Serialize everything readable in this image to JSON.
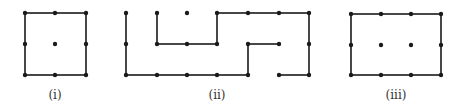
{
  "figures": [
    {
      "id": "i",
      "label": "(i)",
      "label_pos": [
        55,
        99
      ],
      "dots": [
        [
          25,
          13
        ],
        [
          55,
          13
        ],
        [
          86,
          13
        ],
        [
          25,
          44
        ],
        [
          55,
          44
        ],
        [
          86,
          44
        ],
        [
          25,
          75
        ],
        [
          55,
          75
        ],
        [
          86,
          75
        ]
      ],
      "edges": [
        [
          [
            25,
            13
          ],
          [
            55,
            13
          ]
        ],
        [
          [
            55,
            13
          ],
          [
            86,
            13
          ]
        ],
        [
          [
            25,
            13
          ],
          [
            25,
            44
          ]
        ],
        [
          [
            25,
            44
          ],
          [
            25,
            75
          ]
        ],
        [
          [
            86,
            13
          ],
          [
            86,
            44
          ]
        ],
        [
          [
            86,
            44
          ],
          [
            86,
            75
          ]
        ],
        [
          [
            25,
            75
          ],
          [
            55,
            75
          ]
        ],
        [
          [
            55,
            75
          ],
          [
            86,
            75
          ]
        ]
      ]
    },
    {
      "id": "ii",
      "label": "(ii)",
      "label_pos": [
        217,
        99
      ],
      "dots": [
        [
          126,
          13
        ],
        [
          157,
          13
        ],
        [
          187,
          13
        ],
        [
          217,
          13
        ],
        [
          248,
          13
        ],
        [
          279,
          13
        ],
        [
          309,
          13
        ],
        [
          126,
          44
        ],
        [
          157,
          44
        ],
        [
          187,
          44
        ],
        [
          217,
          44
        ],
        [
          248,
          44
        ],
        [
          279,
          44
        ],
        [
          309,
          44
        ],
        [
          126,
          75
        ],
        [
          157,
          75
        ],
        [
          187,
          75
        ],
        [
          217,
          75
        ],
        [
          248,
          75
        ],
        [
          279,
          75
        ],
        [
          309,
          75
        ]
      ],
      "edges": [
        [
          [
            126,
            13
          ],
          [
            126,
            44
          ]
        ],
        [
          [
            126,
            44
          ],
          [
            126,
            75
          ]
        ],
        [
          [
            126,
            75
          ],
          [
            157,
            75
          ]
        ],
        [
          [
            157,
            75
          ],
          [
            187,
            75
          ]
        ],
        [
          [
            187,
            75
          ],
          [
            217,
            75
          ]
        ],
        [
          [
            217,
            75
          ],
          [
            248,
            75
          ]
        ],
        [
          [
            248,
            75
          ],
          [
            248,
            44
          ]
        ],
        [
          [
            248,
            44
          ],
          [
            279,
            44
          ]
        ],
        [
          [
            157,
            13
          ],
          [
            157,
            44
          ]
        ],
        [
          [
            157,
            44
          ],
          [
            187,
            44
          ]
        ],
        [
          [
            187,
            44
          ],
          [
            217,
            44
          ]
        ],
        [
          [
            217,
            44
          ],
          [
            217,
            13
          ]
        ],
        [
          [
            217,
            13
          ],
          [
            248,
            13
          ]
        ],
        [
          [
            248,
            13
          ],
          [
            279,
            13
          ]
        ],
        [
          [
            279,
            13
          ],
          [
            309,
            13
          ]
        ],
        [
          [
            309,
            13
          ],
          [
            309,
            44
          ]
        ],
        [
          [
            309,
            44
          ],
          [
            309,
            75
          ]
        ],
        [
          [
            309,
            75
          ],
          [
            279,
            75
          ]
        ]
      ]
    },
    {
      "id": "iii",
      "label": "(iii)",
      "label_pos": [
        396,
        99
      ],
      "dots": [
        [
          351,
          14
        ],
        [
          381,
          14
        ],
        [
          411,
          14
        ],
        [
          441,
          14
        ],
        [
          351,
          45
        ],
        [
          381,
          45
        ],
        [
          411,
          45
        ],
        [
          441,
          45
        ],
        [
          351,
          75
        ],
        [
          381,
          75
        ],
        [
          411,
          75
        ],
        [
          441,
          75
        ]
      ],
      "edges": [
        [
          [
            351,
            14
          ],
          [
            381,
            14
          ]
        ],
        [
          [
            381,
            14
          ],
          [
            411,
            14
          ]
        ],
        [
          [
            411,
            14
          ],
          [
            441,
            14
          ]
        ],
        [
          [
            351,
            14
          ],
          [
            351,
            45
          ]
        ],
        [
          [
            351,
            45
          ],
          [
            351,
            75
          ]
        ],
        [
          [
            441,
            14
          ],
          [
            441,
            45
          ]
        ],
        [
          [
            441,
            45
          ],
          [
            441,
            75
          ]
        ],
        [
          [
            351,
            75
          ],
          [
            381,
            75
          ]
        ],
        [
          [
            381,
            75
          ],
          [
            411,
            75
          ]
        ],
        [
          [
            411,
            75
          ],
          [
            441,
            75
          ]
        ]
      ]
    }
  ],
  "colors": {
    "ink": "#1a1a1a",
    "label": "#333333",
    "background": "#ffffff"
  }
}
